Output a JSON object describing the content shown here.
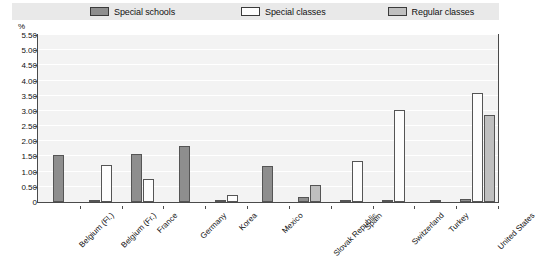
{
  "legend": {
    "items": [
      {
        "label": "Special schools",
        "color": "#8e8e8e"
      },
      {
        "label": "Special classes",
        "color": "#fdfdfd"
      },
      {
        "label": "Regular classes",
        "color": "#bfbfbf"
      }
    ]
  },
  "axis": {
    "unit_label": "%",
    "y_ticks": [
      "5.50",
      "5.00",
      "4.50",
      "4.00",
      "3.50",
      "3.00",
      "2.50",
      "2.00",
      "1.50",
      "1.00",
      "0.50",
      "0"
    ]
  },
  "chart_data": {
    "type": "bar",
    "title": "",
    "subtitle": "",
    "xlabel": "",
    "ylabel": "%",
    "ylim": [
      0,
      5.5
    ],
    "ytick_values": [
      0,
      0.5,
      1.0,
      1.5,
      2.0,
      2.5,
      3.0,
      3.5,
      4.0,
      4.5,
      5.0,
      5.5
    ],
    "grid": true,
    "legend_position": "top",
    "categories": [
      "Belgium (Fl.)",
      "Belgium (Fr.)",
      "France",
      "Germany",
      "Korea",
      "Mexico",
      "Slovak Republic",
      "Spain",
      "Switzerland",
      "Turkey",
      "United States"
    ],
    "series": [
      {
        "name": "Special schools",
        "color": "#8e8e8e",
        "values": [
          1.55,
          0.06,
          1.58,
          1.85,
          0.02,
          1.18,
          0.18,
          0.03,
          0.02,
          0.0,
          0.11
        ]
      },
      {
        "name": "Special classes",
        "color": "#fdfdfd",
        "values": [
          0.0,
          1.22,
          0.75,
          0.0,
          0.22,
          0.0,
          0.0,
          1.35,
          3.02,
          0.0,
          3.58
        ]
      },
      {
        "name": "Regular classes",
        "color": "#bfbfbf",
        "values": [
          0.0,
          0.0,
          0.0,
          0.0,
          0.0,
          0.0,
          0.55,
          0.0,
          0.0,
          0.05,
          2.85
        ]
      }
    ]
  }
}
